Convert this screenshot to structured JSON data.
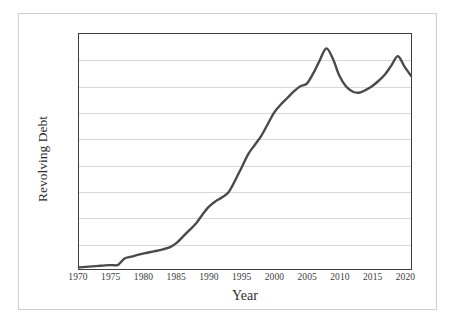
{
  "chart_data": {
    "type": "line",
    "title": "",
    "xlabel": "Year",
    "ylabel": "Revolving Debt",
    "xlim": [
      1970,
      2021
    ],
    "ylim": [
      0,
      9000
    ],
    "grid": true,
    "legend": "none",
    "series_color": "#4a4a4a",
    "x_tick_labels": [
      "1970",
      "1975",
      "1980",
      "1985",
      "1990",
      "1995",
      "2000",
      "2005",
      "2010",
      "2015",
      "2020"
    ],
    "x_ticks": [
      1970,
      1975,
      1980,
      1985,
      1990,
      1995,
      2000,
      2005,
      2010,
      2015,
      2020
    ],
    "y_tick_labels": [
      "$9,000",
      "$8,000",
      "$7,000",
      "$6,000",
      "$5,000",
      "$4,000",
      "$3,000",
      "$2,000",
      "$1,000",
      "$0"
    ],
    "y_ticks": [
      9000,
      8000,
      7000,
      6000,
      5000,
      4000,
      3000,
      2000,
      1000,
      0
    ],
    "x": [
      1970,
      1971,
      1972,
      1973,
      1974,
      1975,
      1976,
      1977,
      1978,
      1979,
      1980,
      1981,
      1982,
      1983,
      1984,
      1985,
      1986,
      1987,
      1988,
      1989,
      1990,
      1991,
      1992,
      1993,
      1994,
      1995,
      1996,
      1997,
      1998,
      1999,
      2000,
      2001,
      2002,
      2003,
      2004,
      2005,
      2006,
      2007,
      2008,
      2009,
      2010,
      2011,
      2012,
      2013,
      2014,
      2015,
      2016,
      2017,
      2018,
      2019,
      2020,
      2021
    ],
    "values": [
      60,
      80,
      100,
      120,
      140,
      150,
      160,
      400,
      470,
      540,
      600,
      650,
      700,
      760,
      840,
      1000,
      1250,
      1500,
      1750,
      2100,
      2400,
      2600,
      2750,
      2950,
      3400,
      3900,
      4400,
      4750,
      5100,
      5550,
      6000,
      6300,
      6550,
      6800,
      7000,
      7100,
      7500,
      8000,
      8450,
      8050,
      7400,
      7000,
      6800,
      6750,
      6850,
      7000,
      7200,
      7450,
      7800,
      8150,
      7750,
      7400
    ],
    "annotations": []
  }
}
